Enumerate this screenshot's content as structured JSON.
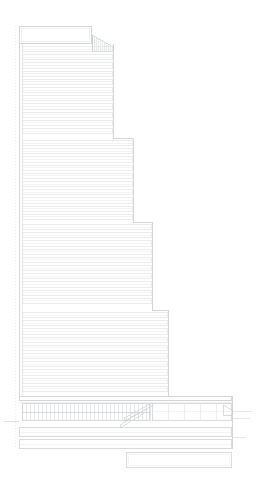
{
  "drawing": {
    "kind": "architectural-elevation",
    "subject": "stepped high-rise tower elevation",
    "sheet": {
      "width": 256,
      "height": 484,
      "background": "#ffffff"
    },
    "line_colors": {
      "outline": "#c9cbcd",
      "floor_band": "#dcdee0",
      "hairline": "#e6e8ea",
      "mullion": "#cfd2d4",
      "dotted_guide": "#e2e4e6",
      "ground_line": "#d2d4d6"
    },
    "title": "",
    "labels": [],
    "dimensions": [],
    "scale_note": ""
  },
  "geometry": {
    "tower_left_x": 19,
    "guide_left_x": 15,
    "inner_strip_x": 22,
    "ground_y": 421,
    "crown": {
      "name": "crown-box",
      "x": 19,
      "y": 26,
      "w": 73,
      "h": 18,
      "inner_inset": 2
    },
    "crown_wing": {
      "name": "crown-wing",
      "x0": 92,
      "y0": 35,
      "x1": 113,
      "y1": 47,
      "hatch_count": 11
    },
    "shafts": [
      {
        "name": "tower-shaft-upper",
        "x": 19,
        "y": 44,
        "w": 94,
        "h": 94,
        "bands": 11,
        "pitch": 8.2
      },
      {
        "name": "tower-shaft-upper-middle",
        "x": 19,
        "y": 138,
        "w": 114,
        "h": 84,
        "bands": 10,
        "pitch": 8.2
      },
      {
        "name": "tower-shaft-lower-middle",
        "x": 19,
        "y": 222,
        "w": 133,
        "h": 88,
        "bands": 11,
        "pitch": 8.2
      },
      {
        "name": "tower-shaft-lower",
        "x": 19,
        "y": 310,
        "w": 149,
        "h": 86,
        "bands": 10,
        "pitch": 8.2
      }
    ],
    "podium": {
      "name": "podium",
      "x": 19,
      "y": 396,
      "w": 213,
      "h": 29,
      "roof_band_y": 396,
      "roof_band_h": 5,
      "colonnade": {
        "x": 22,
        "y": 403,
        "w": 128,
        "h": 18,
        "mullion_count": 32,
        "tier_split_y": 412
      },
      "right_bay": {
        "x": 152,
        "y": 403,
        "w": 80,
        "h": 18,
        "panels": 5
      },
      "canopy": {
        "name": "entrance-canopy",
        "x0": 124,
        "y0": 418,
        "x1": 152,
        "y1": 403
      },
      "bracket": {
        "x": 223,
        "y": 405,
        "w": 9,
        "h": 10
      }
    },
    "base_bands": [
      {
        "name": "base-band-upper",
        "x": 19,
        "y": 427,
        "w": 213,
        "h": 10
      },
      {
        "name": "base-band-lower",
        "x": 19,
        "y": 439,
        "w": 213,
        "h": 10
      }
    ],
    "lower_slab": {
      "name": "lower-slab",
      "x": 126,
      "y": 452,
      "w": 106,
      "h": 16
    },
    "ground_line": {
      "x0": 4,
      "y": 421,
      "x1": 19
    },
    "right_extension_lines": [
      {
        "x0": 232,
        "y": 411,
        "x1": 252
      },
      {
        "x0": 232,
        "y": 418,
        "x1": 250
      },
      {
        "x0": 232,
        "y": 437,
        "x1": 246
      }
    ]
  }
}
